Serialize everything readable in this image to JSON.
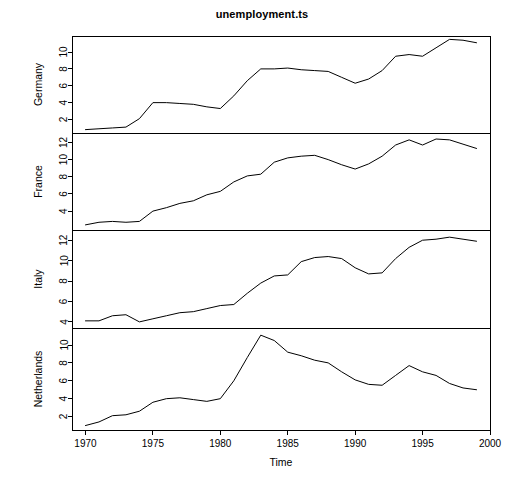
{
  "chart_data": {
    "type": "line",
    "title": "unemployment.ts",
    "xlabel": "Time",
    "ylabel": "",
    "grid": false,
    "legend": "none",
    "multi_panel": true,
    "panel_layout": "4 stacked panels sharing one Time axis",
    "x": [
      1970,
      1971,
      1972,
      1973,
      1974,
      1975,
      1976,
      1977,
      1978,
      1979,
      1980,
      1981,
      1982,
      1983,
      1984,
      1985,
      1986,
      1987,
      1988,
      1989,
      1990,
      1991,
      1992,
      1993,
      1994,
      1995,
      1996,
      1997,
      1998,
      1999
    ],
    "xlim": [
      1969,
      2000
    ],
    "xticks": [
      1970,
      1975,
      1980,
      1985,
      1990,
      1995,
      2000
    ],
    "xticklabels": [
      "1970",
      "1975",
      "1980",
      "1985",
      "1990",
      "1995",
      "2000"
    ],
    "panels": [
      {
        "name": "germany-panel",
        "ylabel": "Germany",
        "ylim": [
          0.4,
          11.9
        ],
        "yticks": [
          2,
          4,
          6,
          8,
          10
        ],
        "yticklabels": [
          "2",
          "4",
          "6",
          "8",
          "10"
        ],
        "values": [
          0.8,
          0.9,
          1.0,
          1.1,
          2.1,
          4.0,
          4.0,
          3.9,
          3.8,
          3.5,
          3.3,
          4.8,
          6.6,
          8.0,
          8.0,
          8.1,
          7.9,
          7.8,
          7.7,
          7.0,
          6.3,
          6.8,
          7.8,
          9.5,
          9.7,
          9.5,
          10.5,
          11.5,
          11.4,
          11.1
        ]
      },
      {
        "name": "france-panel",
        "ylabel": "France",
        "ylim": [
          1.8,
          13.1
        ],
        "yticks": [
          4,
          6,
          8,
          10,
          12
        ],
        "yticklabels": [
          "4",
          "6",
          "8",
          "10",
          "12"
        ],
        "values": [
          2.4,
          2.7,
          2.8,
          2.7,
          2.8,
          4.0,
          4.4,
          4.9,
          5.2,
          5.9,
          6.3,
          7.4,
          8.1,
          8.3,
          9.7,
          10.2,
          10.4,
          10.5,
          10.0,
          9.4,
          8.9,
          9.5,
          10.4,
          11.7,
          12.3,
          11.7,
          12.4,
          12.3,
          11.8,
          11.3
        ]
      },
      {
        "name": "italy-panel",
        "ylabel": "Italy",
        "ylim": [
          3.4,
          13.0
        ],
        "yticks": [
          4,
          6,
          8,
          10,
          12
        ],
        "yticklabels": [
          "4",
          "6",
          "8",
          "10",
          "12"
        ],
        "values": [
          4.1,
          4.1,
          4.6,
          4.7,
          4.0,
          4.3,
          4.6,
          4.9,
          5.0,
          5.3,
          5.6,
          5.7,
          6.8,
          7.8,
          8.5,
          8.6,
          9.9,
          10.3,
          10.4,
          10.2,
          9.3,
          8.7,
          8.8,
          10.2,
          11.3,
          12.0,
          12.1,
          12.3,
          12.1,
          11.9
        ]
      },
      {
        "name": "netherlands-panel",
        "ylabel": "Netherlands",
        "ylim": [
          0.5,
          11.9
        ],
        "yticks": [
          2,
          4,
          6,
          8,
          10
        ],
        "yticklabels": [
          "2",
          "4",
          "6",
          "8",
          "10"
        ],
        "values": [
          1.0,
          1.4,
          2.1,
          2.2,
          2.6,
          3.6,
          4.0,
          4.1,
          3.9,
          3.7,
          4.0,
          6.0,
          8.6,
          11.1,
          10.5,
          9.2,
          8.8,
          8.3,
          8.0,
          7.0,
          6.1,
          5.6,
          5.5,
          6.6,
          7.7,
          7.0,
          6.6,
          5.7,
          5.2,
          5.0
        ]
      }
    ]
  },
  "axis": {
    "x_title": "Time"
  }
}
